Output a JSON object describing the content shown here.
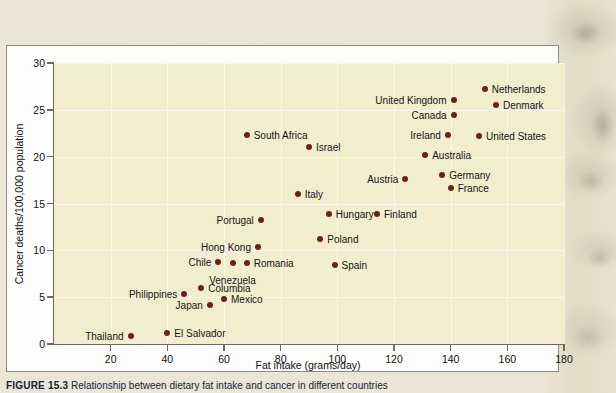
{
  "figure": {
    "caption_number": "FIGURE 15.3",
    "caption_text": "Relationship between dietary fat intake and cancer in different countries"
  },
  "chart_data": {
    "type": "scatter",
    "title": "",
    "xlabel": "Fat intake (grams/day)",
    "ylabel": "Cancer deaths/100,000 population",
    "xlim": [
      0,
      180
    ],
    "ylim": [
      0,
      30
    ],
    "xticks": [
      20,
      40,
      60,
      80,
      100,
      120,
      140,
      160,
      180
    ],
    "yticks": [
      0,
      5,
      10,
      15,
      20,
      25,
      30
    ],
    "grid": true,
    "legend": "none",
    "point_color": "#69231f",
    "plot_background": "#f2edcf",
    "points": [
      {
        "label": "Netherlands",
        "x": 152,
        "y": 27.2,
        "side": "right"
      },
      {
        "label": "United Kingdom",
        "x": 141,
        "y": 26.0,
        "side": "left"
      },
      {
        "label": "Denmark",
        "x": 156,
        "y": 25.5,
        "side": "right"
      },
      {
        "label": "Canada",
        "x": 141,
        "y": 24.5,
        "side": "left"
      },
      {
        "label": "Ireland",
        "x": 139,
        "y": 22.3,
        "side": "left"
      },
      {
        "label": "United States",
        "x": 150,
        "y": 22.2,
        "side": "right"
      },
      {
        "label": "South Africa",
        "x": 68,
        "y": 22.3,
        "side": "right"
      },
      {
        "label": "Israel",
        "x": 90,
        "y": 21.0,
        "side": "right"
      },
      {
        "label": "Australia",
        "x": 131,
        "y": 20.2,
        "side": "right"
      },
      {
        "label": "Germany",
        "x": 137,
        "y": 18.0,
        "side": "right"
      },
      {
        "label": "Austria",
        "x": 124,
        "y": 17.6,
        "side": "left"
      },
      {
        "label": "France",
        "x": 140,
        "y": 16.7,
        "side": "right"
      },
      {
        "label": "Italy",
        "x": 86,
        "y": 16.0,
        "side": "right"
      },
      {
        "label": "Hungary",
        "x": 97,
        "y": 13.9,
        "side": "right"
      },
      {
        "label": "Finland",
        "x": 114,
        "y": 13.9,
        "side": "right"
      },
      {
        "label": "Portugal",
        "x": 73,
        "y": 13.2,
        "side": "left"
      },
      {
        "label": "Poland",
        "x": 94,
        "y": 11.2,
        "side": "right"
      },
      {
        "label": "Hong Kong",
        "x": 72,
        "y": 10.4,
        "side": "left"
      },
      {
        "label": "Romania",
        "x": 68,
        "y": 8.7,
        "side": "right"
      },
      {
        "label": "Spain",
        "x": 99,
        "y": 8.4,
        "side": "right"
      },
      {
        "label": "Chile",
        "x": 58,
        "y": 8.8,
        "side": "left"
      },
      {
        "label": "Venezuela",
        "x": 63,
        "y": 8.7,
        "side": "none"
      },
      {
        "label": "Columbia",
        "x": 52,
        "y": 6.0,
        "side": "right"
      },
      {
        "label": "Mexico",
        "x": 60,
        "y": 4.8,
        "side": "right"
      },
      {
        "label": "Philippines",
        "x": 46,
        "y": 5.3,
        "side": "left"
      },
      {
        "label": "Japan",
        "x": 55,
        "y": 4.2,
        "side": "left"
      },
      {
        "label": "El Salvador",
        "x": 40,
        "y": 1.2,
        "side": "right"
      },
      {
        "label": "Thailand",
        "x": 27,
        "y": 0.9,
        "side": "left"
      }
    ]
  }
}
